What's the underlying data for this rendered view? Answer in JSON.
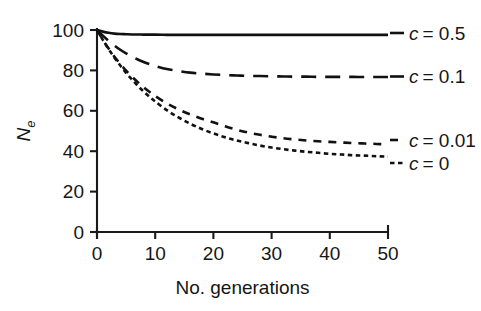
{
  "chart_data": {
    "type": "line",
    "title": "",
    "xlabel": "No. generations",
    "ylabel": "Ne",
    "ylabel_base": "N",
    "ylabel_sub": "e",
    "xlim": [
      0,
      50
    ],
    "ylim": [
      0,
      100
    ],
    "xticks": [
      0,
      10,
      20,
      30,
      40,
      50
    ],
    "yticks": [
      0,
      20,
      40,
      60,
      80,
      100
    ],
    "xtick_labels": [
      "0",
      "10",
      "20",
      "30",
      "40",
      "50"
    ],
    "ytick_labels": [
      "0",
      "20",
      "40",
      "60",
      "80",
      "100"
    ],
    "grid": false,
    "legend_position": "right-of-axes-inline",
    "x": [
      0,
      1,
      2,
      3,
      4,
      5,
      6,
      7,
      8,
      9,
      10,
      12,
      14,
      16,
      18,
      20,
      22,
      24,
      26,
      28,
      30,
      32,
      34,
      36,
      38,
      40,
      42,
      44,
      46,
      48,
      50
    ],
    "series": [
      {
        "name": "c = 0.5",
        "label_c": "c",
        "label_eq": "= 0.5",
        "c_value": 0.5,
        "linestyle": "solid",
        "dasharray": "",
        "linewidth": 2.6,
        "color": "#111111",
        "values": [
          100,
          99.2,
          98.6,
          98.2,
          98.0,
          97.9,
          97.8,
          97.8,
          97.7,
          97.7,
          97.7,
          97.6,
          97.6,
          97.6,
          97.6,
          97.6,
          97.6,
          97.6,
          97.6,
          97.6,
          97.6,
          97.6,
          97.6,
          97.6,
          97.6,
          97.6,
          97.6,
          97.6,
          97.6,
          97.6,
          97.6
        ],
        "plateau": 97.6
      },
      {
        "name": "c = 0.1",
        "label_c": "c",
        "label_eq": "= 0.1",
        "c_value": 0.1,
        "linestyle": "long-dash",
        "dasharray": "15 9",
        "linewidth": 2.6,
        "color": "#111111",
        "values": [
          100,
          97.2,
          94.6,
          92.3,
          90.2,
          88.4,
          86.8,
          85.4,
          84.2,
          83.1,
          82.2,
          80.7,
          79.7,
          78.9,
          78.4,
          78.0,
          77.7,
          77.5,
          77.3,
          77.2,
          77.1,
          77.0,
          76.9,
          76.9,
          76.8,
          76.8,
          76.8,
          76.8,
          76.7,
          76.7,
          76.7
        ],
        "plateau": 76.7
      },
      {
        "name": "c = 0.01",
        "label_c": "c",
        "label_eq": "= 0.01",
        "c_value": 0.01,
        "linestyle": "dash",
        "dasharray": "8 7",
        "linewidth": 2.6,
        "color": "#111111",
        "values": [
          100,
          95.2,
          90.8,
          86.8,
          83.2,
          79.9,
          76.9,
          74.2,
          71.7,
          69.4,
          67.3,
          63.7,
          60.7,
          58.2,
          56.1,
          54.3,
          52.3,
          50.6,
          49.2,
          48.1,
          47.2,
          46.4,
          45.8,
          45.3,
          44.9,
          44.6,
          44.3,
          44.0,
          43.8,
          43.6,
          43.4
        ],
        "plateau": 43.4
      },
      {
        "name": "c = 0",
        "label_c": "c",
        "label_eq": "= 0",
        "c_value": 0,
        "linestyle": "dotted-dash",
        "dasharray": "4.5 3.5",
        "linewidth": 2.6,
        "color": "#111111",
        "values": [
          100,
          95.1,
          90.5,
          86.3,
          82.4,
          78.8,
          75.5,
          72.4,
          69.6,
          67.0,
          64.6,
          60.3,
          56.7,
          53.6,
          51.0,
          48.8,
          46.9,
          45.3,
          44.0,
          42.8,
          41.8,
          41.0,
          40.3,
          39.7,
          39.2,
          38.7,
          38.4,
          38.0,
          37.8,
          37.5,
          37.3
        ],
        "plateau": 37.3
      }
    ]
  },
  "legend": {
    "entries": [
      {
        "c_italic": "c",
        "rest": "= 0.5"
      },
      {
        "c_italic": "c",
        "rest": "= 0.1"
      },
      {
        "c_italic": "c",
        "rest": "= 0.01"
      },
      {
        "c_italic": "c",
        "rest": "= 0"
      }
    ]
  },
  "colors": {
    "line": "#111111",
    "axis": "#1a1a1a",
    "text": "#161616",
    "background": "#ffffff"
  }
}
